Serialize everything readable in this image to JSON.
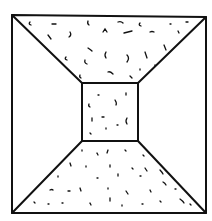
{
  "diagram": {
    "outer_square": {
      "x1": 12,
      "y1": 15,
      "x2": 206,
      "y2": 213
    },
    "inner_square": {
      "x1": 82,
      "y1": 83,
      "x2": 138,
      "y2": 141
    },
    "stroke_color": "#111111",
    "background_color": "#ffffff",
    "textured_regions": [
      "top-trapezoid",
      "back-wall",
      "bottom-trapezoid"
    ],
    "plain_regions": [
      "left-trapezoid",
      "right-trapezoid"
    ]
  }
}
